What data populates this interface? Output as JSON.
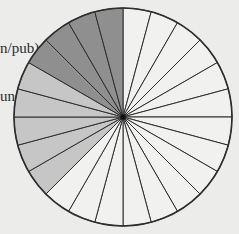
{
  "page_text": {
    "lines": [
      "n/pub)",
      "und"
    ]
  },
  "colors": {
    "background": "#ececea",
    "dark": "#8f8f8f",
    "medium": "#c6c6c6",
    "light": "#f1f1ef",
    "stroke": "#2e2e2e"
  },
  "chart_data": {
    "type": "pie",
    "title": "",
    "slice_count": 24,
    "slice_angle_deg": 15,
    "start_angle": "12 o'clock, clockwise",
    "categories": [
      "white",
      "medium gray",
      "dark gray"
    ],
    "values": [
      15,
      5,
      4
    ],
    "slices": [
      "light",
      "light",
      "light",
      "light",
      "light",
      "light",
      "light",
      "light",
      "light",
      "light",
      "light",
      "light",
      "light",
      "light",
      "light",
      "medium",
      "medium",
      "medium",
      "medium",
      "medium",
      "dark",
      "dark",
      "dark",
      "dark"
    ],
    "center": [
      123,
      117
    ],
    "radius": 109,
    "legend": "none",
    "grid": false
  }
}
